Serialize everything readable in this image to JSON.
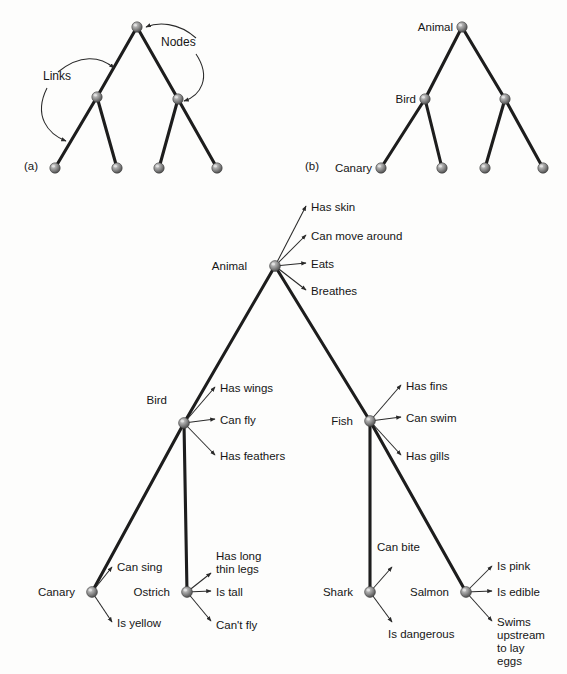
{
  "figure": {
    "background_color": "#fdfdfc",
    "node_color": "#8a8a8a",
    "link_color": "#1d1d1d",
    "text_color": "#161616"
  },
  "panel_a": {
    "tag": "(a)",
    "tag_pos": {
      "x": 24,
      "y": 170
    },
    "annotations": [
      {
        "label": "Nodes",
        "x": 161,
        "y": 46
      },
      {
        "label": "Links",
        "x": 43,
        "y": 80
      }
    ],
    "nodes": [
      {
        "name": "root",
        "x": 137,
        "y": 27
      },
      {
        "name": "mid-left",
        "x": 97,
        "y": 97
      },
      {
        "name": "mid-right",
        "x": 178,
        "y": 99
      },
      {
        "name": "leaf-1",
        "x": 55,
        "y": 168
      },
      {
        "name": "leaf-2",
        "x": 117,
        "y": 168
      },
      {
        "name": "leaf-3",
        "x": 159,
        "y": 168
      },
      {
        "name": "leaf-4",
        "x": 217,
        "y": 168
      }
    ],
    "links": [
      [
        137,
        27,
        97,
        97
      ],
      [
        137,
        27,
        178,
        99
      ],
      [
        97,
        97,
        55,
        168
      ],
      [
        97,
        97,
        117,
        168
      ],
      [
        178,
        99,
        159,
        168
      ],
      [
        178,
        99,
        217,
        168
      ]
    ],
    "pointers": [
      {
        "name": "nodes-to-root",
        "d": "M 196 38 C 178 22 158 22 146 27"
      },
      {
        "name": "nodes-to-midright",
        "d": "M 196 54 C 212 78 200 96 184 101"
      },
      {
        "name": "links-to-upper",
        "d": "M 58 72 C 80 54 100 56 114 68"
      },
      {
        "name": "links-to-lower",
        "d": "M 47 88 C 33 116 48 134 66 141"
      }
    ]
  },
  "panel_b": {
    "tag": "(b)",
    "tag_pos": {
      "x": 305,
      "y": 170
    },
    "nodes": [
      {
        "name": "animal",
        "x": 462,
        "y": 27,
        "label": "Animal",
        "label_side": "left"
      },
      {
        "name": "bird",
        "x": 425,
        "y": 99,
        "label": "Bird",
        "label_side": "left"
      },
      {
        "name": "fish",
        "x": 505,
        "y": 99,
        "label": "",
        "label_side": "left"
      },
      {
        "name": "canary",
        "x": 381,
        "y": 168,
        "label": "Canary",
        "label_side": "left"
      },
      {
        "name": "ostrich",
        "x": 442,
        "y": 168,
        "label": "",
        "label_side": "left"
      },
      {
        "name": "shark",
        "x": 485,
        "y": 168,
        "label": "",
        "label_side": "left"
      },
      {
        "name": "salmon",
        "x": 543,
        "y": 168,
        "label": "",
        "label_side": "left"
      }
    ],
    "links": [
      [
        462,
        27,
        425,
        99
      ],
      [
        462,
        27,
        505,
        99
      ],
      [
        425,
        99,
        381,
        168
      ],
      [
        425,
        99,
        442,
        168
      ],
      [
        505,
        99,
        485,
        168
      ],
      [
        505,
        99,
        543,
        168
      ]
    ]
  },
  "main_network": {
    "nodes": [
      {
        "name": "animal",
        "label": "Animal",
        "x": 275,
        "y": 266,
        "label_x": 247,
        "label_y": 270,
        "label_anchor": "end"
      },
      {
        "name": "bird",
        "label": "Bird",
        "x": 184,
        "y": 423,
        "label_x": 167,
        "label_y": 404,
        "label_anchor": "end"
      },
      {
        "name": "fish",
        "label": "Fish",
        "x": 370,
        "y": 421,
        "label_x": 353,
        "label_y": 425,
        "label_anchor": "end"
      },
      {
        "name": "canary",
        "label": "Canary",
        "x": 92,
        "y": 592,
        "label_x": 75,
        "label_y": 596,
        "label_anchor": "end"
      },
      {
        "name": "ostrich",
        "label": "Ostrich",
        "x": 187,
        "y": 592,
        "label_x": 170,
        "label_y": 596,
        "label_anchor": "end"
      },
      {
        "name": "shark",
        "label": "Shark",
        "x": 370,
        "y": 592,
        "label_x": 353,
        "label_y": 596,
        "label_anchor": "end"
      },
      {
        "name": "salmon",
        "label": "Salmon",
        "x": 466,
        "y": 592,
        "label_x": 449,
        "label_y": 596,
        "label_anchor": "end"
      }
    ],
    "links": [
      {
        "name": "animal-bird",
        "from": [
          275,
          266
        ],
        "to": [
          184,
          423
        ]
      },
      {
        "name": "animal-fish",
        "from": [
          275,
          266
        ],
        "to": [
          370,
          421
        ]
      },
      {
        "name": "bird-canary",
        "from": [
          184,
          423
        ],
        "to": [
          92,
          592
        ]
      },
      {
        "name": "bird-ostrich",
        "from": [
          184,
          423
        ],
        "to": [
          187,
          592
        ]
      },
      {
        "name": "fish-shark",
        "from": [
          370,
          421
        ],
        "to": [
          370,
          592
        ]
      },
      {
        "name": "fish-salmon",
        "from": [
          370,
          421
        ],
        "to": [
          466,
          592
        ]
      }
    ],
    "properties": [
      {
        "owner": "animal",
        "items": [
          {
            "text": "Has skin",
            "tip": [
              306,
              206
            ],
            "label_x": 311,
            "label_y": 211,
            "lines": [
              "Has skin"
            ]
          },
          {
            "text": "Can move around",
            "tip": [
              306,
              235
            ],
            "label_x": 311,
            "label_y": 240,
            "lines": [
              "Can move around"
            ]
          },
          {
            "text": "Eats",
            "tip": [
              306,
              263
            ],
            "label_x": 311,
            "label_y": 268,
            "lines": [
              "Eats"
            ]
          },
          {
            "text": "Breathes",
            "tip": [
              306,
              290
            ],
            "label_x": 311,
            "label_y": 295,
            "lines": [
              "Breathes"
            ]
          }
        ]
      },
      {
        "owner": "bird",
        "items": [
          {
            "text": "Has wings",
            "tip": [
              215,
              387
            ],
            "label_x": 220,
            "label_y": 392,
            "lines": [
              "Has wings"
            ]
          },
          {
            "text": "Can fly",
            "tip": [
              215,
              419
            ],
            "label_x": 220,
            "label_y": 424,
            "lines": [
              "Can fly"
            ]
          },
          {
            "text": "Has feathers",
            "tip": [
              215,
              455
            ],
            "label_x": 220,
            "label_y": 460,
            "lines": [
              "Has feathers"
            ]
          }
        ]
      },
      {
        "owner": "fish",
        "items": [
          {
            "text": "Has fins",
            "tip": [
              401,
              385
            ],
            "label_x": 406,
            "label_y": 390,
            "lines": [
              "Has fins"
            ]
          },
          {
            "text": "Can swim",
            "tip": [
              401,
              417
            ],
            "label_x": 406,
            "label_y": 422,
            "lines": [
              "Can swim"
            ]
          },
          {
            "text": "Has gills",
            "tip": [
              401,
              455
            ],
            "label_x": 406,
            "label_y": 460,
            "lines": [
              "Has gills"
            ]
          }
        ]
      },
      {
        "owner": "canary",
        "items": [
          {
            "text": "Can sing",
            "tip": [
              112,
              567
            ],
            "label_x": 117,
            "label_y": 571,
            "lines": [
              "Can sing"
            ]
          },
          {
            "text": "Is yellow",
            "tip": [
              112,
              622
            ],
            "label_x": 117,
            "label_y": 627,
            "lines": [
              "Is yellow"
            ]
          }
        ]
      },
      {
        "owner": "ostrich",
        "items": [
          {
            "text": "Has long thin legs",
            "tip": [
              211,
              573
            ],
            "label_x": 216,
            "label_y": 560,
            "lines": [
              "Has long",
              "thin legs"
            ]
          },
          {
            "text": "Is tall",
            "tip": [
              211,
              591
            ],
            "label_x": 216,
            "label_y": 596,
            "lines": [
              "Is tall"
            ]
          },
          {
            "text": "Can't fly",
            "tip": [
              211,
              621
            ],
            "label_x": 216,
            "label_y": 629,
            "lines": [
              "Can't fly"
            ]
          }
        ]
      },
      {
        "owner": "shark",
        "items": [
          {
            "text": "Can bite",
            "tip": [
              392,
              567
            ],
            "label_x": 377,
            "label_y": 551,
            "lines": [
              "Can bite"
            ]
          },
          {
            "text": "Is dangerous",
            "tip": [
              392,
              622
            ],
            "label_x": 388,
            "label_y": 638,
            "lines": [
              "Is dangerous"
            ]
          }
        ]
      },
      {
        "owner": "salmon",
        "items": [
          {
            "text": "Is pink",
            "tip": [
              492,
              566
            ],
            "label_x": 497,
            "label_y": 570,
            "lines": [
              "Is pink"
            ]
          },
          {
            "text": "Is edible",
            "tip": [
              492,
              591
            ],
            "label_x": 497,
            "label_y": 596,
            "lines": [
              "Is edible"
            ]
          },
          {
            "text": "Swims upstream to lay eggs",
            "tip": [
              492,
              621
            ],
            "label_x": 497,
            "label_y": 626,
            "lines": [
              "Swims",
              "upstream",
              "to lay",
              "eggs"
            ]
          }
        ]
      }
    ]
  }
}
